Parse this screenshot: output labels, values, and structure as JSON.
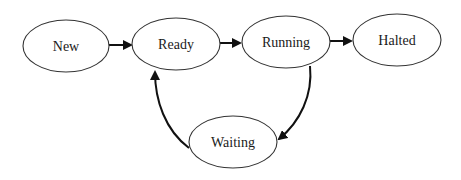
{
  "diagram": {
    "colors": {
      "background": "#ffffff",
      "node_stroke": "#333333",
      "edge": "#111111",
      "text": "#1a1a1a"
    },
    "nodes": [
      {
        "id": "new",
        "label": "New",
        "cx": 66,
        "cy": 46,
        "rx": 43,
        "ry": 26
      },
      {
        "id": "ready",
        "label": "Ready",
        "cx": 176,
        "cy": 44,
        "rx": 44,
        "ry": 26
      },
      {
        "id": "running",
        "label": "Running",
        "cx": 286,
        "cy": 42,
        "rx": 44,
        "ry": 26
      },
      {
        "id": "halted",
        "label": "Halted",
        "cx": 397,
        "cy": 40,
        "rx": 44,
        "ry": 26
      },
      {
        "id": "waiting",
        "label": "Waiting",
        "cx": 233,
        "cy": 142,
        "rx": 44,
        "ry": 26
      }
    ],
    "edges": [
      {
        "from": "new",
        "to": "ready",
        "shape": "straight"
      },
      {
        "from": "ready",
        "to": "running",
        "shape": "straight"
      },
      {
        "from": "running",
        "to": "halted",
        "shape": "straight"
      },
      {
        "from": "running",
        "to": "waiting",
        "shape": "curved"
      },
      {
        "from": "waiting",
        "to": "ready",
        "shape": "curved"
      }
    ]
  }
}
